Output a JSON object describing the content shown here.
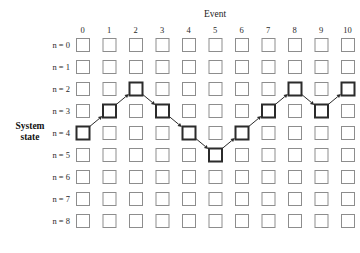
{
  "figure": {
    "kind": "state-transition-trellis-diagram",
    "top_axis_title": "Event",
    "side_axis_title_line1": "System",
    "side_axis_title_line2": "state",
    "column_labels": [
      "0",
      "1",
      "2",
      "3",
      "4",
      "5",
      "6",
      "7",
      "8",
      "9",
      "10"
    ],
    "row_labels": [
      "n = 0",
      "n = 1",
      "n = 2",
      "n = 3",
      "n = 4",
      "n = 5",
      "n = 6",
      "n = 7",
      "n = 8"
    ],
    "colors": {
      "background": "#ffffff",
      "cell_border": "#8d8d8d",
      "cell_fill": "#ffffff",
      "active_border": "#2b2b2b",
      "arrow": "#2b2b2b",
      "text": "#1c1c1c"
    },
    "grid": {
      "columns": 11,
      "rows": 9,
      "cell_size": 13,
      "col_pitch": 26.5,
      "row_pitch": 22,
      "origin_x": 76,
      "origin_y": 38
    },
    "path": {
      "description": "System state trajectory across events",
      "points": [
        {
          "event": 0,
          "state": 4
        },
        {
          "event": 1,
          "state": 3
        },
        {
          "event": 2,
          "state": 2
        },
        {
          "event": 3,
          "state": 3
        },
        {
          "event": 4,
          "state": 4
        },
        {
          "event": 5,
          "state": 5
        },
        {
          "event": 6,
          "state": 4
        },
        {
          "event": 7,
          "state": 3
        },
        {
          "event": 8,
          "state": 2
        },
        {
          "event": 9,
          "state": 3
        },
        {
          "event": 10,
          "state": 2
        }
      ]
    }
  }
}
